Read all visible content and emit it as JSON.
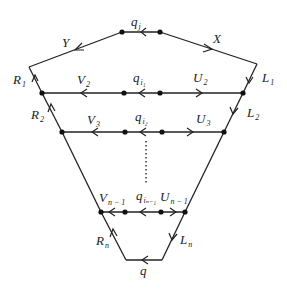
{
  "diagram": {
    "type": "directed-graph",
    "labels": {
      "top_segment": {
        "main": "q",
        "sub": "j"
      },
      "left_top": {
        "main": "Y"
      },
      "right_top": {
        "main": "X"
      },
      "R1": {
        "main": "R",
        "sub": "1"
      },
      "L1": {
        "main": "L",
        "sub": "1"
      },
      "V2": {
        "main": "V",
        "sub": "2"
      },
      "qi1": {
        "main": "q",
        "sub": "i₁"
      },
      "U2": {
        "main": "U",
        "sub": "2"
      },
      "R2": {
        "main": "R",
        "sub": "2"
      },
      "L2": {
        "main": "L",
        "sub": "2"
      },
      "V3": {
        "main": "V",
        "sub": "3"
      },
      "qi2": {
        "main": "q",
        "sub": "i₂"
      },
      "U3": {
        "main": "U",
        "sub": "3"
      },
      "Vn1": {
        "main": "V",
        "sub": "n − 1"
      },
      "qin1": {
        "main": "q",
        "sub": "iₙ₋₁"
      },
      "Un1": {
        "main": "U",
        "sub": "n − 1"
      },
      "Rn": {
        "main": "R",
        "sub": "n"
      },
      "Ln": {
        "main": "L",
        "sub": "n"
      },
      "bottom": {
        "main": "q"
      }
    }
  }
}
